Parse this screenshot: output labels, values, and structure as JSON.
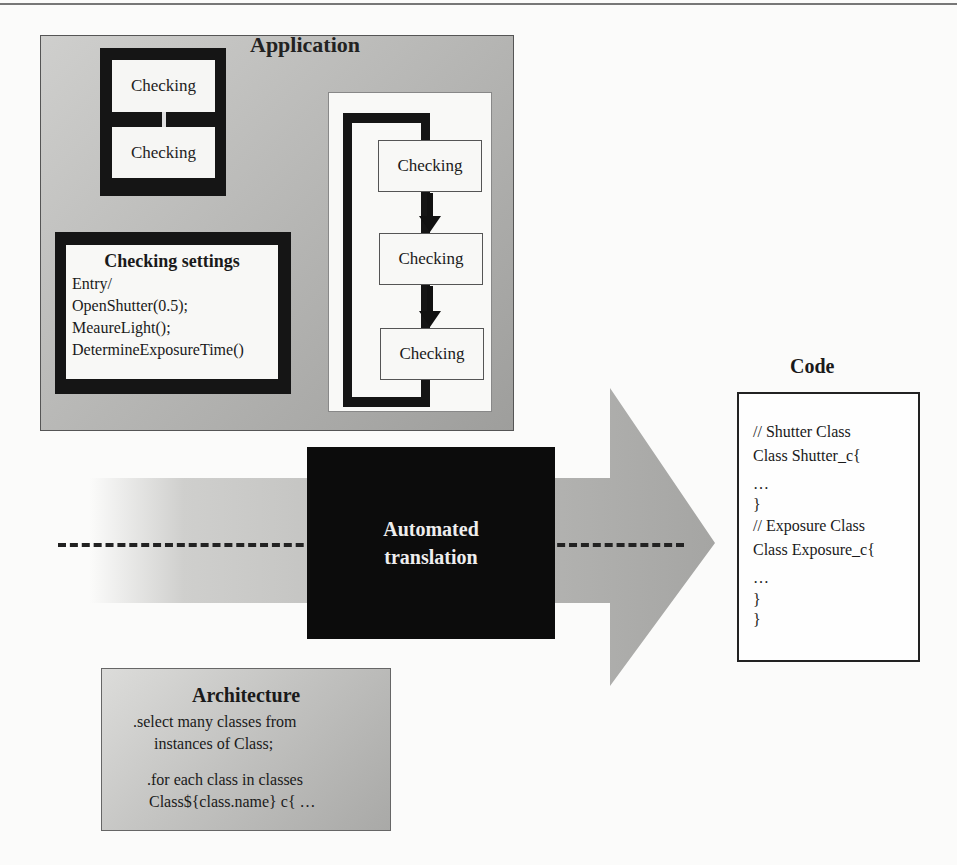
{
  "application": {
    "title": "Application",
    "state_pair": [
      "Checking",
      "Checking"
    ],
    "settings": {
      "title": "Checking settings",
      "lines": [
        "Entry/",
        "OpenShutter(0.5);",
        "MeaureLight();",
        "DetermineExposureTime()"
      ]
    },
    "flow": [
      "Checking",
      "Checking",
      "Checking"
    ]
  },
  "translation": {
    "line1": "Automated",
    "line2": "translation"
  },
  "code": {
    "title": "Code",
    "lines": [
      "// Shutter Class",
      "Class Shutter_c{",
      "…",
      "}",
      "// Exposure Class",
      "Class Exposure_c{",
      "…",
      "}",
      "}"
    ]
  },
  "architecture": {
    "title": "Architecture",
    "lines": [
      ".select many classes from",
      "instances of Class;",
      ".for each class in classes",
      "Class${class.name} c{ …"
    ]
  },
  "colors": {
    "panel_gray": "#b4b4b2",
    "arrow_gray": "#9a9a98",
    "arrow_light": "#c8c8c6",
    "frame_black": "#151515",
    "translation_bg": "#0c0c0c"
  }
}
